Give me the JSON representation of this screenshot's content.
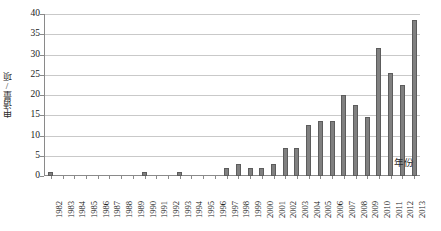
{
  "chart_data": {
    "type": "bar",
    "title": "",
    "subtitle": "",
    "xlabel": "年份",
    "ylabel": "申请量/项",
    "ylim": [
      0,
      40
    ],
    "yticks": [
      0,
      5,
      10,
      15,
      20,
      25,
      30,
      35,
      40
    ],
    "ytick_labels": [
      "0",
      "5",
      "10",
      "15",
      "20",
      "25",
      "30",
      "35",
      "40"
    ],
    "grid": "horizontal",
    "legend": "none",
    "bar_color": "#808080",
    "bar_border_color": "#5c5c5c",
    "gridline_color": "#c9c9c9",
    "axis_color": "#8a8a8a",
    "categories": [
      "1982",
      "1983",
      "1984",
      "1985",
      "1986",
      "1987",
      "1988",
      "1989",
      "1990",
      "1991",
      "1992",
      "1993",
      "1994",
      "1995",
      "1996",
      "1997",
      "1998",
      "1999",
      "2000",
      "2001",
      "2002",
      "2003",
      "2004",
      "2005",
      "2006",
      "2007",
      "2008",
      "2009",
      "2010",
      "2011",
      "2012",
      "2013"
    ],
    "values": [
      1,
      0,
      0,
      0,
      0,
      0,
      0,
      0,
      1,
      0,
      0,
      1,
      0,
      0,
      0,
      2,
      3,
      2,
      2,
      3,
      7,
      7,
      12.5,
      13.5,
      13.5,
      20,
      17.5,
      14.5,
      31.5,
      25.5,
      22.5,
      38.5
    ],
    "extra_value_2013": 28,
    "note": "final category 2013 value 28 appended after 2012 value 38.5"
  }
}
